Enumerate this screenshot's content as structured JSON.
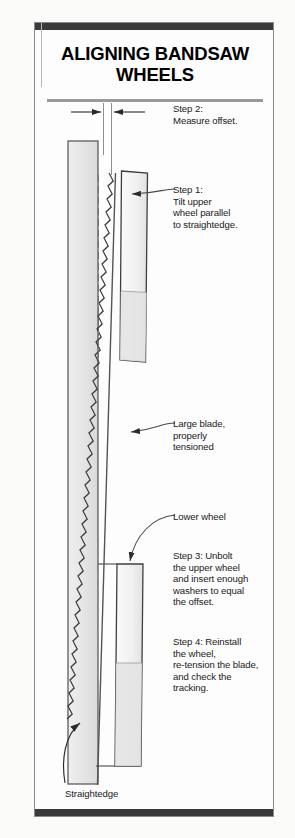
{
  "title": "ALIGNING BANDSAW WHEELS",
  "annotations": {
    "step2": "Step 2:\nMeasure offset.",
    "step1": "Step 1:\nTilt upper\nwheel parallel\nto straightedge.",
    "large_blade": "Large blade,\nproperly\ntensioned",
    "lower_wheel": "Lower wheel",
    "step3": "Step 3: Unbolt\nthe upper wheel\nand insert enough\nwashers to equal\nthe offset.",
    "step4": "Step 4: Reinstall\nthe wheel,\nre-tension the blade,\nand check the\ntracking.",
    "straightedge": "Straightedge"
  },
  "colors": {
    "header_bar": "#3a3a3a",
    "frame_border": "#8a8a8a",
    "title_rule": "#9a9a9a",
    "part_fill": "#e8e8e8",
    "part_fill_light": "#f2f2f2",
    "outline": "#3a3a3a",
    "text": "#1a1a1a"
  },
  "diagram": {
    "type": "technical-illustration",
    "parts": [
      {
        "name": "straightedge",
        "shape": "vertical-bar",
        "x": 33,
        "y": 118,
        "width": 30,
        "height": 643
      },
      {
        "name": "upper-wheel",
        "shape": "tilted-bar",
        "x": 86,
        "y": 148,
        "width": 26,
        "height": 190
      },
      {
        "name": "lower-wheel",
        "shape": "vertical-bar",
        "x": 82,
        "y": 541,
        "width": 26,
        "height": 202
      },
      {
        "name": "blade",
        "shape": "toothed-band",
        "top_x": 74,
        "bottom_x": 62,
        "y_top": 148,
        "y_bottom": 765
      },
      {
        "name": "offset-dimension",
        "shape": "dimension-arrows",
        "y": 88,
        "left_x": 44,
        "right_x": 90
      }
    ]
  }
}
